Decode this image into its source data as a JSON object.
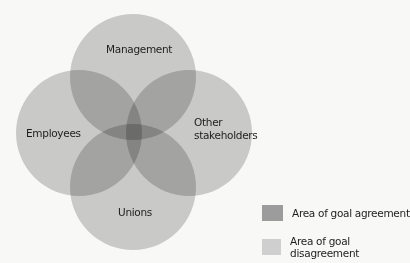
{
  "diagram": {
    "type": "venn",
    "circles": [
      {
        "id": "management",
        "label": "Management",
        "cx": 133,
        "cy": 77,
        "r": 63
      },
      {
        "id": "employees",
        "label": "Employees",
        "cx": 79,
        "cy": 133,
        "r": 63
      },
      {
        "id": "other",
        "label_line1": "Other",
        "label_line2": "stakeholders",
        "cx": 189,
        "cy": 133,
        "r": 63
      },
      {
        "id": "unions",
        "label": "Unions",
        "cx": 133,
        "cy": 187,
        "r": 63
      }
    ],
    "colors": {
      "background": "#f8f8f7",
      "disagreement": "#cfcfcf",
      "agreement": "#9c9c9c",
      "circle_fill": "#cccccc"
    }
  },
  "legend": [
    {
      "label": "Area of goal agreement",
      "color": "#9c9c9c"
    },
    {
      "label": "Area of goal disagreement",
      "color": "#cfcfcf"
    }
  ]
}
